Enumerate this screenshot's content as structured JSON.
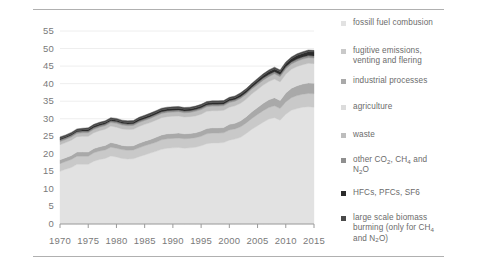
{
  "chart_data": {
    "type": "area",
    "title": "",
    "subtitle": "",
    "xlabel": "",
    "ylabel": "",
    "stacked": true,
    "grid": true,
    "legend_position": "right",
    "xlim": [
      1970,
      2015
    ],
    "ylim": [
      0,
      57
    ],
    "yticks": [
      0,
      5,
      10,
      15,
      20,
      25,
      30,
      35,
      40,
      45,
      50,
      55
    ],
    "xticks": [
      1970,
      1975,
      1980,
      1985,
      1990,
      1995,
      2000,
      2005,
      2010,
      2015
    ],
    "x": [
      1970,
      1971,
      1972,
      1973,
      1974,
      1975,
      1976,
      1977,
      1978,
      1979,
      1980,
      1981,
      1982,
      1983,
      1984,
      1985,
      1986,
      1987,
      1988,
      1989,
      1990,
      1991,
      1992,
      1993,
      1994,
      1995,
      1996,
      1997,
      1998,
      1999,
      2000,
      2001,
      2002,
      2003,
      2004,
      2005,
      2006,
      2007,
      2008,
      2009,
      2010,
      2011,
      2012,
      2013,
      2014,
      2015
    ],
    "series": [
      {
        "name": "fossill fuel combusion",
        "color": "#e2e2e2",
        "values": [
          15.0,
          15.6,
          16.1,
          17.0,
          17.0,
          17.0,
          17.9,
          18.4,
          18.7,
          19.4,
          19.1,
          18.7,
          18.5,
          18.6,
          19.2,
          19.7,
          20.2,
          20.7,
          21.3,
          21.6,
          21.7,
          21.8,
          21.6,
          21.7,
          21.9,
          22.3,
          22.9,
          23.1,
          23.1,
          23.2,
          23.9,
          24.2,
          24.7,
          25.8,
          27.0,
          28.0,
          29.0,
          29.9,
          30.3,
          29.6,
          31.3,
          32.4,
          32.9,
          33.3,
          33.4,
          33.3
        ]
      },
      {
        "name": "fugitive emissions, venting and flering",
        "color": "#c9c9c9",
        "values": [
          2.2,
          2.2,
          2.3,
          2.3,
          2.3,
          2.3,
          2.4,
          2.4,
          2.4,
          2.5,
          2.5,
          2.5,
          2.5,
          2.5,
          2.5,
          2.6,
          2.6,
          2.6,
          2.7,
          2.7,
          2.7,
          2.7,
          2.7,
          2.7,
          2.7,
          2.7,
          2.8,
          2.8,
          2.8,
          2.8,
          2.9,
          2.9,
          3.0,
          3.0,
          3.1,
          3.2,
          3.3,
          3.3,
          3.4,
          3.3,
          3.5,
          3.6,
          3.7,
          3.7,
          3.8,
          3.8
        ]
      },
      {
        "name": "industrial processes",
        "color": "#a9a9a9",
        "values": [
          1.1,
          1.1,
          1.1,
          1.2,
          1.2,
          1.2,
          1.2,
          1.2,
          1.3,
          1.3,
          1.3,
          1.2,
          1.2,
          1.2,
          1.3,
          1.3,
          1.3,
          1.4,
          1.4,
          1.4,
          1.4,
          1.4,
          1.4,
          1.4,
          1.4,
          1.5,
          1.5,
          1.5,
          1.5,
          1.5,
          1.6,
          1.6,
          1.7,
          1.8,
          1.9,
          2.0,
          2.1,
          2.2,
          2.3,
          2.3,
          2.5,
          2.7,
          2.8,
          2.9,
          3.0,
          3.0
        ]
      },
      {
        "name": "agriculture",
        "color": "#dcdcdc",
        "values": [
          4.3,
          4.3,
          4.4,
          4.4,
          4.5,
          4.5,
          4.5,
          4.6,
          4.6,
          4.7,
          4.7,
          4.7,
          4.7,
          4.7,
          4.8,
          4.8,
          4.8,
          4.9,
          4.9,
          4.9,
          4.9,
          4.9,
          4.8,
          4.8,
          4.8,
          4.8,
          4.9,
          4.9,
          4.9,
          4.9,
          4.9,
          5.0,
          5.0,
          5.0,
          5.1,
          5.1,
          5.2,
          5.2,
          5.3,
          5.3,
          5.4,
          5.4,
          5.5,
          5.5,
          5.6,
          5.6
        ]
      },
      {
        "name": "waste",
        "color": "#bdbdbd",
        "values": [
          0.9,
          0.9,
          0.9,
          0.9,
          1.0,
          1.0,
          1.0,
          1.0,
          1.0,
          1.0,
          1.1,
          1.1,
          1.1,
          1.1,
          1.1,
          1.1,
          1.2,
          1.2,
          1.2,
          1.2,
          1.2,
          1.2,
          1.2,
          1.2,
          1.3,
          1.3,
          1.3,
          1.3,
          1.3,
          1.3,
          1.3,
          1.3,
          1.4,
          1.4,
          1.4,
          1.4,
          1.4,
          1.4,
          1.5,
          1.5,
          1.5,
          1.5,
          1.5,
          1.6,
          1.6,
          1.6
        ]
      },
      {
        "name": "other CO2, CH4 and N2O",
        "color": "#8f8f8f",
        "values": [
          0.5,
          0.5,
          0.5,
          0.5,
          0.5,
          0.5,
          0.5,
          0.5,
          0.5,
          0.5,
          0.5,
          0.5,
          0.5,
          0.5,
          0.5,
          0.5,
          0.5,
          0.5,
          0.5,
          0.5,
          0.5,
          0.5,
          0.5,
          0.5,
          0.5,
          0.5,
          0.5,
          0.5,
          0.5,
          0.5,
          0.5,
          0.5,
          0.5,
          0.5,
          0.5,
          0.6,
          0.6,
          0.6,
          0.6,
          0.6,
          0.6,
          0.6,
          0.6,
          0.6,
          0.6,
          0.6
        ]
      },
      {
        "name": "HFCs, PFCs, SF6",
        "color": "#2b2b2b",
        "values": [
          0.3,
          0.3,
          0.3,
          0.3,
          0.3,
          0.4,
          0.4,
          0.4,
          0.4,
          0.4,
          0.4,
          0.4,
          0.4,
          0.4,
          0.5,
          0.5,
          0.5,
          0.5,
          0.5,
          0.5,
          0.5,
          0.5,
          0.5,
          0.5,
          0.5,
          0.5,
          0.5,
          0.5,
          0.5,
          0.5,
          0.5,
          0.5,
          0.6,
          0.6,
          0.6,
          0.7,
          0.7,
          0.8,
          0.8,
          0.8,
          0.9,
          0.9,
          1.0,
          1.0,
          1.1,
          1.1
        ]
      },
      {
        "name": "large scale biomass burming (only for CH4 and N2O)",
        "color": "#4a4a4a",
        "values": [
          0.5,
          0.5,
          0.5,
          0.5,
          0.5,
          0.5,
          0.5,
          0.5,
          0.5,
          0.5,
          0.5,
          0.5,
          0.5,
          0.5,
          0.5,
          0.5,
          0.5,
          0.5,
          0.5,
          0.5,
          0.5,
          0.5,
          0.5,
          0.5,
          0.5,
          0.5,
          0.5,
          0.5,
          0.5,
          0.5,
          0.5,
          0.5,
          0.5,
          0.5,
          0.5,
          0.5,
          0.5,
          0.5,
          0.5,
          0.5,
          0.5,
          0.5,
          0.5,
          0.5,
          0.5,
          0.5
        ]
      }
    ]
  },
  "axes": {
    "y_ticks": [
      "0",
      "5",
      "10",
      "15",
      "20",
      "25",
      "30",
      "35",
      "40",
      "45",
      "50",
      "55"
    ],
    "x_ticks": [
      "1970",
      "1975",
      "1980",
      "1985",
      "1990",
      "1995",
      "2000",
      "2005",
      "2010",
      "2015"
    ]
  },
  "legend": {
    "items": [
      {
        "id": "fossil-fuel-combustion",
        "label": "fossill fuel combusion",
        "color": "#e2e2e2",
        "lines": [
          "fossill fuel combusion"
        ]
      },
      {
        "id": "fugitive-emissions",
        "label": "fugitive emissions, venting and flering",
        "color": "#c9c9c9",
        "lines": [
          "fugitive emissions,",
          "venting and flering"
        ]
      },
      {
        "id": "industrial-processes",
        "label": "industrial processes",
        "color": "#a9a9a9",
        "lines": [
          "industrial processes"
        ]
      },
      {
        "id": "agriculture",
        "label": "agriculture",
        "color": "#dcdcdc",
        "lines": [
          "agriculture"
        ]
      },
      {
        "id": "waste",
        "label": "waste",
        "color": "#bdbdbd",
        "lines": [
          "waste"
        ]
      },
      {
        "id": "other-co2-ch4-n2o",
        "label": "other CO2, CH4 and N2O",
        "color": "#8f8f8f",
        "lines": [
          "other CO2, CH4 and",
          "N2O"
        ]
      },
      {
        "id": "hfcs-pfcs-sf6",
        "label": "HFCs, PFCs, SF6",
        "color": "#2b2b2b",
        "lines": [
          "HFCs, PFCs, SF6"
        ]
      },
      {
        "id": "large-scale-biomass-burning",
        "label": "large scale biomass burming (only for CH4 and N2O)",
        "color": "#4a4a4a",
        "lines": [
          "large scale biomass",
          "burming (only for CH4",
          "and N2O)"
        ]
      }
    ]
  },
  "colors": {
    "rule": "#b0b0b0",
    "axis": "#9a9a9a",
    "grid": "#eeeeee",
    "text": "#6e6e6e"
  }
}
